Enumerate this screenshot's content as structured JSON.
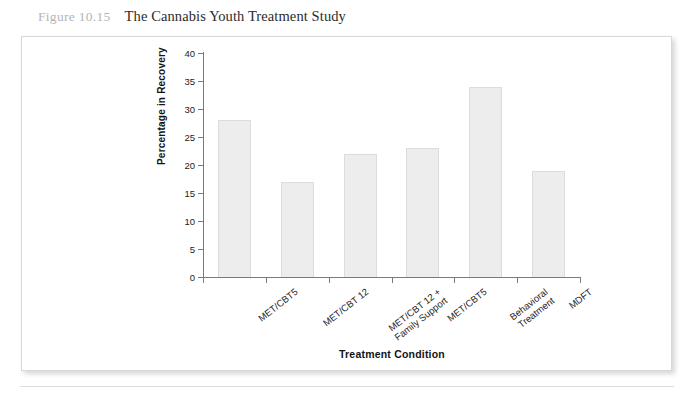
{
  "figure": {
    "number": "Figure 10.15",
    "title": "The Cannabis Youth Treatment Study"
  },
  "chart_data": {
    "type": "bar",
    "title": "The Cannabis Youth Treatment Study",
    "categories": [
      "MET/CBT5",
      "MET/CBT 12",
      "MET/CBT 12 +\nFamily Support",
      "MET/CBT5",
      "Behavioral\nTreatment",
      "MDFT"
    ],
    "values": [
      28,
      17,
      22,
      23,
      34,
      19
    ],
    "xlabel": "Treatment Condition",
    "ylabel": "Percentage in Recovery",
    "ylim": [
      0,
      40
    ],
    "ytick_step": 5,
    "yticks": [
      "0",
      "5",
      "10",
      "15",
      "20",
      "25",
      "30",
      "35",
      "40"
    ],
    "grid": false,
    "legend": null,
    "bar_fill": "#ededed",
    "bar_edge": "#dcdcdc",
    "axis_color": "#7a7a7a"
  }
}
